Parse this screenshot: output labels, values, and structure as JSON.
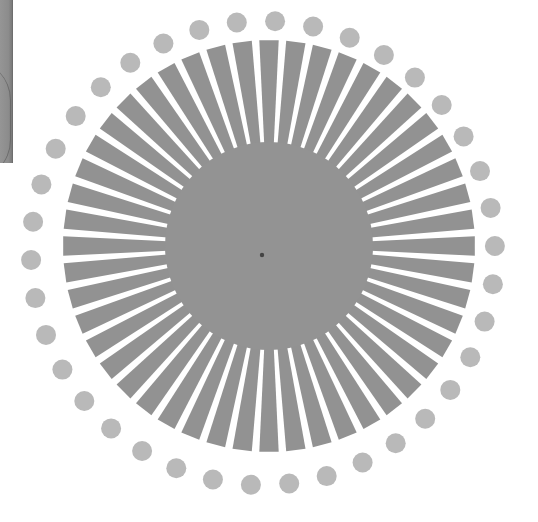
{
  "canvas": {
    "width": 538,
    "height": 522,
    "background": "#ffffff"
  },
  "photo_strip": {
    "x": 0,
    "y": 0,
    "width": 12,
    "height": 163,
    "color": "#8c8c8c"
  },
  "starburst": {
    "center": {
      "x": 269,
      "y": 246
    },
    "ray_count": 48,
    "ray_inner_radius": 100,
    "ray_outer_radius": 206,
    "ray_fill_fraction": 0.72,
    "ray_color": "#929292",
    "core_radius": 104,
    "core_color": "#939393",
    "center_dot": {
      "x": 262,
      "y": 255,
      "r": 2.2,
      "color": "#444444"
    }
  },
  "dot_ring": {
    "center": {
      "x": 263,
      "y": 253
    },
    "radius": 232,
    "dot_count": 38,
    "dot_radius": 10,
    "start_angle_deg": -87,
    "color": "#b9b9b9"
  }
}
